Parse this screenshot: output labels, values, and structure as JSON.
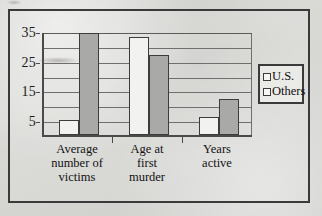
{
  "chart_data": {
    "type": "bar",
    "title": "",
    "xlabel": "",
    "ylabel": "",
    "categories": [
      "Average number of victims",
      "Age at first murder",
      "Years active"
    ],
    "category_lines": [
      [
        "Average",
        "number of",
        "victims"
      ],
      [
        "Age at",
        "first",
        "murder"
      ],
      [
        "Years",
        "active"
      ]
    ],
    "series": [
      {
        "name": "U.S.",
        "values": [
          5,
          33,
          6
        ],
        "color": "#f2f2f0"
      },
      {
        "name": "Others",
        "values": [
          34.5,
          27,
          12
        ],
        "color": "#a9a9a7"
      }
    ],
    "ylim": [
      0,
      35
    ],
    "yticks_major": [
      5,
      15,
      25,
      35
    ],
    "yticks_minor": [
      10,
      20,
      30
    ],
    "ytick_labels": [
      "35",
      "25",
      "15",
      "5"
    ],
    "grid": true,
    "legend_position": "right-outside"
  },
  "legend": {
    "items": [
      {
        "label": "U.S.",
        "swatch": "white-square"
      },
      {
        "label": "Others",
        "swatch": "gray-square"
      }
    ]
  },
  "colors": {
    "series_us": "#f2f2f0",
    "series_others": "#a9a9a7",
    "axis": "#4a4a4a",
    "grid": "#6f6f6f",
    "frame": "#3a3a3a",
    "page_background": "#d9d9d6",
    "text": "#121212"
  }
}
